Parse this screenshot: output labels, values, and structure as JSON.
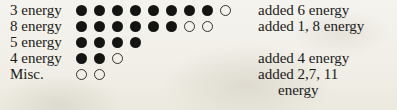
{
  "sheet": {
    "title": "energy tally sheet",
    "background_color": "#f2f0ea",
    "ink_color": "#141412",
    "dot_spacing_px": 18,
    "glyphs": {
      "filled": "filled-circle",
      "open": "open-circle"
    },
    "rows": [
      {
        "label": "3 energy",
        "filled": 8,
        "open": 1,
        "note": "added 6 energy",
        "note_indented": false,
        "top": 2
      },
      {
        "label": "8 energy",
        "filled": 6,
        "open": 2,
        "note": "added 1, 8 energy",
        "note_indented": false,
        "top": 18
      },
      {
        "label": "5 energy",
        "filled": 4,
        "open": 0,
        "note": "",
        "note_indented": false,
        "top": 34
      },
      {
        "label": "4 energy",
        "filled": 2,
        "open": 1,
        "note": "added 4 energy",
        "note_indented": false,
        "top": 50
      },
      {
        "label": "Misc.",
        "filled": 0,
        "open": 2,
        "note": "added 2,7, 11",
        "note_indented": false,
        "top": 66
      },
      {
        "label": "",
        "filled": 0,
        "open": 0,
        "note": "energy",
        "note_indented": true,
        "top": 82
      }
    ]
  }
}
